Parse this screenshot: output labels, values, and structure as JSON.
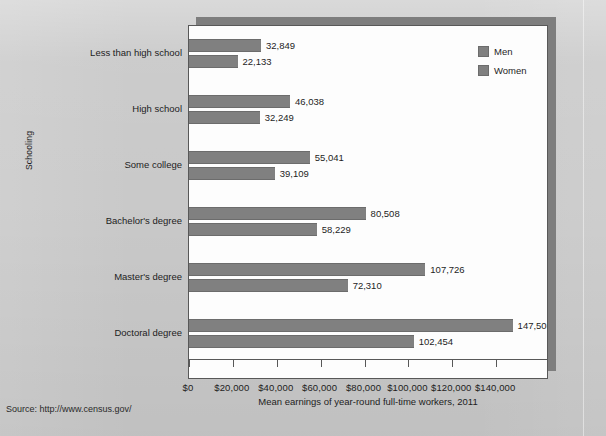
{
  "source_caption": "Source: http://www.census.gov/",
  "legend": {
    "position": "top-right",
    "entries": [
      {
        "label": "Men",
        "color": "#808080"
      },
      {
        "label": "Women",
        "color": "#808080"
      }
    ]
  },
  "chart_data": {
    "type": "bar",
    "orientation": "horizontal",
    "title": "",
    "subtitle": "",
    "xlabel": "Mean earnings of year-round full-time workers, 2011",
    "ylabel": "Schooling",
    "xlim": [
      0,
      160000
    ],
    "xtick_values": [
      0,
      20000,
      40000,
      60000,
      80000,
      100000,
      120000,
      140000
    ],
    "xtick_labels": [
      "$0",
      "$20,000",
      "$40,000",
      "$60,000",
      "$80,000",
      "$100,000",
      "$120,000",
      "$140,000"
    ],
    "grid": false,
    "categories": [
      "Less than high school",
      "High school",
      "Some college",
      "Bachelor's degree",
      "Master's degree",
      "Doctoral degree"
    ],
    "series": [
      {
        "name": "Men",
        "color": "#808080",
        "values": [
          32849,
          46038,
          55041,
          80508,
          107726,
          147508
        ],
        "data_labels": [
          "32,849",
          "46,038",
          "55,041",
          "80,508",
          "107,726",
          "147,508"
        ]
      },
      {
        "name": "Women",
        "color": "#808080",
        "values": [
          22133,
          32249,
          39109,
          58229,
          72310,
          102454
        ],
        "data_labels": [
          "22,133",
          "32,249",
          "39,109",
          "58,229",
          "72,310",
          "102,454"
        ]
      }
    ]
  }
}
